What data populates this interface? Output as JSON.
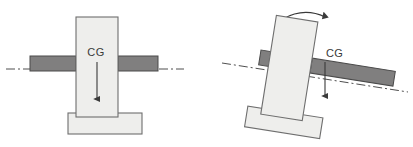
{
  "figure": {
    "canvas": {
      "width": 413,
      "height": 147,
      "background": "#ffffff"
    },
    "colors": {
      "beam_fill": "#807f7f",
      "beam_stroke": "#4a4a4a",
      "column_fill": "#eeeeec",
      "column_stroke": "#6e6e6e",
      "base_fill": "#eeeeec",
      "base_stroke": "#6e6e6e",
      "arrow": "#3a3a3a",
      "centerline": "#3a3a3a",
      "label_text": "#3a3a3a"
    },
    "panels": [
      {
        "id": "upright",
        "name": "upright-configuration",
        "tilt_degrees": 0,
        "cg_label": "CG",
        "cg_label_x": 96,
        "cg_label_y": 56,
        "column": {
          "x": 76,
          "y": 17,
          "width": 42,
          "height": 100
        },
        "base": {
          "x": 68,
          "y": 113,
          "width": 74,
          "height": 21
        },
        "beam_left": {
          "x": 30,
          "y": 56,
          "width": 46,
          "height": 15
        },
        "beam_right": {
          "x": 118,
          "y": 56,
          "width": 40,
          "height": 15
        },
        "gravity_arrow": {
          "x": 97,
          "y_start": 62,
          "y_end": 103
        },
        "centerline_y": 69,
        "centerline_x_start": 6,
        "centerline_x_end": 184,
        "rotation_arc": null
      },
      {
        "id": "tilted",
        "name": "tilted-configuration",
        "tilt_degrees": 9,
        "cg_label": "CG",
        "cg_label_x": 326,
        "cg_label_y": 57,
        "column": {
          "x": 268,
          "y": 18,
          "width": 42,
          "height": 100
        },
        "base": {
          "x": 254,
          "y": 112,
          "width": 76,
          "height": 21
        },
        "beam_left": {
          "x": 258,
          "y": 58,
          "width": 32,
          "height": 15
        },
        "beam_right": {
          "x": 310,
          "y": 58,
          "width": 84,
          "height": 15
        },
        "gravity_arrow": {
          "x": 325,
          "y_start": 62,
          "y_end": 100
        },
        "centerline_y": 72,
        "centerline_x_start": 222,
        "centerline_x_end": 408,
        "rotation_arc": {
          "x_start": 283,
          "y_start": 19,
          "x_end": 326,
          "y_end": 20,
          "direction": "clockwise"
        }
      }
    ]
  }
}
